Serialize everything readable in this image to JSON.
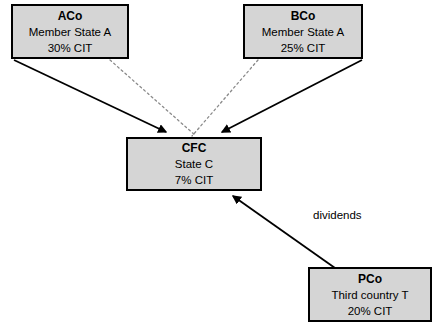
{
  "diagram": {
    "background_color": "#ffffff",
    "box_fill_color": "#d5d5d5",
    "box_border_color": "#000000",
    "line_color": "#000000",
    "dotted_line_color": "#808080"
  },
  "nodes": {
    "aco": {
      "name": "ACo",
      "jurisdiction": "Member State A",
      "tax_rate": "30% CIT"
    },
    "bco": {
      "name": "BCo",
      "jurisdiction": "Member State A",
      "tax_rate": "25% CIT"
    },
    "cfc": {
      "name": "CFC",
      "jurisdiction": "State C",
      "tax_rate": "7% CIT"
    },
    "pco": {
      "name": "PCo",
      "jurisdiction": "Third country T",
      "tax_rate": "20% CIT"
    }
  },
  "edges": {
    "aco_to_cfc_solid": {
      "label": "",
      "style": "solid",
      "from": "aco",
      "to": "cfc"
    },
    "bco_to_cfc_solid": {
      "label": "",
      "style": "solid",
      "from": "bco",
      "to": "cfc"
    },
    "aco_to_cfc_dotted": {
      "label": "",
      "style": "dotted",
      "from": "aco",
      "to": "cfc"
    },
    "bco_to_cfc_dotted": {
      "label": "",
      "style": "dotted",
      "from": "bco",
      "to": "cfc"
    },
    "pco_to_cfc": {
      "label": "dividends",
      "style": "solid",
      "from": "pco",
      "to": "cfc"
    }
  }
}
